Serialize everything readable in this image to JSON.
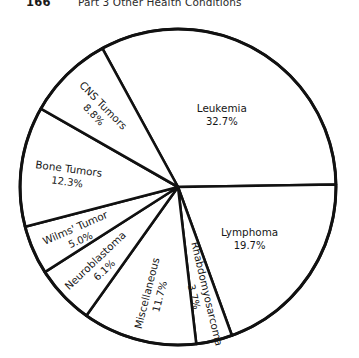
{
  "running_head": {
    "folio": "166",
    "title": "Part 3 Other Health Conditions"
  },
  "chart_data": {
    "type": "pie",
    "title": "",
    "subtitle": "",
    "xlabel": "",
    "ylabel": "",
    "legend_position": "none",
    "grid": false,
    "value_unit": "percent",
    "total": 100.0,
    "stroke_color": "#111111",
    "slice_fill": "#ffffff",
    "start_angle_deg": -118.6,
    "direction": "clockwise",
    "categories": [
      "Leukemia",
      "Lymphoma",
      "Rhabdomyosarcoma",
      "Miscellaneous",
      "Neuroblastoma",
      "Wilms' Tumor",
      "Bone Tumors",
      "CNS Tumors"
    ],
    "values": [
      32.7,
      19.7,
      3.7,
      11.7,
      6.1,
      5.0,
      12.3,
      8.8
    ],
    "slices": [
      {
        "label": "Leukemia",
        "value": 32.7,
        "value_text": "32.7%"
      },
      {
        "label": "Lymphoma",
        "value": 19.7,
        "value_text": "19.7%"
      },
      {
        "label": "Rhabdomyosarcoma",
        "value": 3.7,
        "value_text": "3.7%"
      },
      {
        "label": "Miscellaneous",
        "value": 11.7,
        "value_text": "11.7%"
      },
      {
        "label": "Neuroblastoma",
        "value": 6.1,
        "value_text": "6.1%"
      },
      {
        "label": "Wilms' Tumor",
        "value": 5.0,
        "value_text": "5.0%"
      },
      {
        "label": "Bone Tumors",
        "value": 12.3,
        "value_text": "12.3%"
      },
      {
        "label": "CNS Tumors",
        "value": 8.8,
        "value_text": "8.8%"
      }
    ]
  }
}
